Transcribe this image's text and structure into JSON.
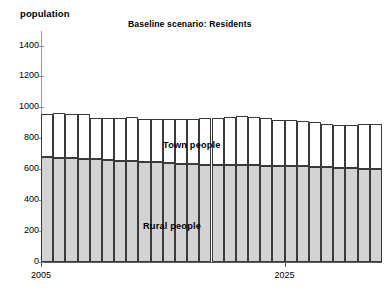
{
  "chart_data": {
    "type": "bar",
    "stacked": true,
    "title": "Baseline scenario: Residents",
    "xlabel": "",
    "ylabel": "population",
    "ylim": [
      0,
      1400
    ],
    "yticks": [
      0,
      200,
      400,
      600,
      800,
      1000,
      1200,
      1400
    ],
    "grid": false,
    "legend_position": "in-plot-annotation",
    "x": [
      2005,
      2006,
      2007,
      2008,
      2009,
      2010,
      2011,
      2012,
      2013,
      2014,
      2015,
      2016,
      2017,
      2018,
      2019,
      2020,
      2021,
      2022,
      2023,
      2024,
      2025,
      2026,
      2027,
      2028,
      2029,
      2030,
      2031,
      2032
    ],
    "xtick_labels": [
      "2005",
      "2025"
    ],
    "xtick_values": [
      2005,
      2025
    ],
    "categories": [
      "2005",
      "2006",
      "2007",
      "2008",
      "2009",
      "2010",
      "2011",
      "2012",
      "2013",
      "2014",
      "2015",
      "2016",
      "2017",
      "2018",
      "2019",
      "2020",
      "2021",
      "2022",
      "2023",
      "2024",
      "2025",
      "2026",
      "2027",
      "2028",
      "2029",
      "2030",
      "2031",
      "2032"
    ],
    "series": [
      {
        "name": "Rural people",
        "color": "#d3d3d3",
        "values": [
          678,
          675,
          672,
          668,
          663,
          658,
          655,
          652,
          648,
          645,
          640,
          636,
          632,
          630,
          628,
          627,
          626,
          625,
          624,
          622,
          620,
          618,
          615,
          612,
          610,
          607,
          604,
          600
        ]
      },
      {
        "name": "Town people",
        "color": "#ffffff",
        "values": [
          282,
          290,
          288,
          292,
          267,
          272,
          275,
          288,
          277,
          278,
          282,
          288,
          296,
          300,
          306,
          313,
          316,
          312,
          305,
          296,
          300,
          296,
          290,
          283,
          278,
          281,
          288,
          292
        ]
      }
    ],
    "totals": [
      960,
      965,
      960,
      960,
      930,
      930,
      930,
      940,
      925,
      923,
      922,
      924,
      928,
      930,
      934,
      940,
      942,
      937,
      929,
      918,
      920,
      914,
      905,
      895,
      888,
      888,
      892,
      892
    ]
  },
  "annotations": {
    "town_label": "Town people",
    "rural_label": "Rural people"
  }
}
